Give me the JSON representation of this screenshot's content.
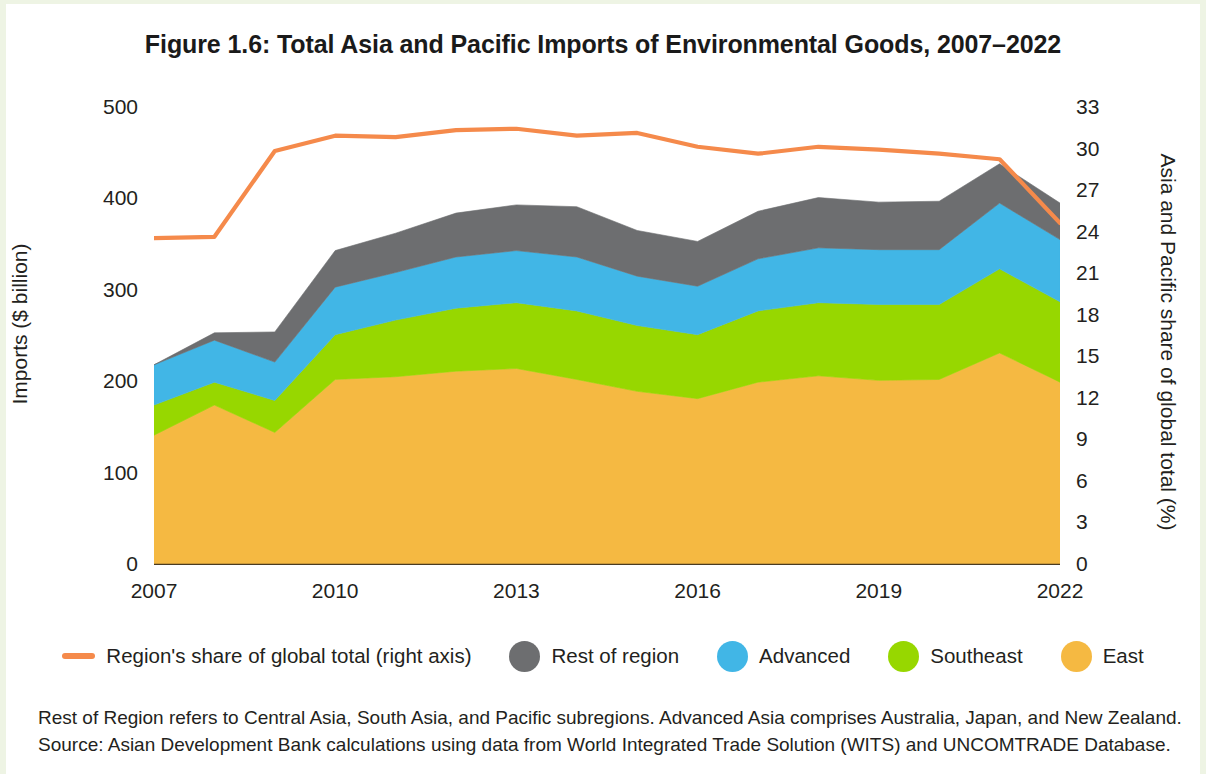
{
  "figure": {
    "title": "Figure 1.6: Total Asia and Pacific Imports of Environmental Goods, 2007–2022"
  },
  "axes": {
    "left_label": "Imports ($ billion)",
    "right_label": "Asia and Pacific share of global total (%)",
    "left_ticks": [
      "500",
      "400",
      "300",
      "200",
      "100",
      "0"
    ],
    "right_ticks": [
      "33",
      "30",
      "27",
      "24",
      "21",
      "18",
      "15",
      "12",
      "9",
      "6",
      "3",
      "0"
    ],
    "x_ticks": [
      "2007",
      "2010",
      "2013",
      "2016",
      "2019",
      "2022"
    ]
  },
  "legend": {
    "items": [
      {
        "label": "Region's share of global total (right axis)",
        "color": "#f58a4b",
        "marker": "line",
        "icon": "legend-line-icon"
      },
      {
        "label": "Rest of region",
        "color": "#6d6e70",
        "marker": "dot",
        "icon": "legend-dot-icon"
      },
      {
        "label": "Advanced",
        "color": "#41b6e6",
        "marker": "dot",
        "icon": "legend-dot-icon"
      },
      {
        "label": "Southeast",
        "color": "#97d700",
        "marker": "dot",
        "icon": "legend-dot-icon"
      },
      {
        "label": "East",
        "color": "#f5b942",
        "marker": "dot",
        "icon": "legend-dot-icon"
      }
    ]
  },
  "footnote": {
    "line1": "Rest of Region refers to Central Asia, South Asia, and Pacific subregions. Advanced Asia comprises Australia, Japan, and New Zealand.",
    "line2": "Source: Asian Development Bank calculations using data from World Integrated Trade Solution (WITS) and UNCOMTRADE Database."
  },
  "chart_data": {
    "type": "area",
    "title": "Figure 1.6: Total Asia and Pacific Imports of Environmental Goods, 2007–2022",
    "subtitle": "",
    "xlabel": "",
    "ylabel": "Imports ($ billion)",
    "y2label": "Asia and Pacific share of global total (%)",
    "stacked": true,
    "grid": false,
    "legend_position": "bottom",
    "x": [
      2007,
      2008,
      2009,
      2010,
      2011,
      2012,
      2013,
      2014,
      2015,
      2016,
      2017,
      2018,
      2019,
      2020,
      2021,
      2022
    ],
    "xlim": [
      2007,
      2022
    ],
    "ylim": [
      0,
      500
    ],
    "y2lim": [
      0,
      33
    ],
    "yticks": [
      0,
      100,
      200,
      300,
      400,
      500
    ],
    "y2ticks": [
      0,
      3,
      6,
      9,
      12,
      15,
      18,
      21,
      24,
      27,
      30,
      33
    ],
    "xticks": [
      2007,
      2010,
      2013,
      2016,
      2019,
      2022
    ],
    "series": [
      {
        "name": "East",
        "color": "#f5b942",
        "axis": "left",
        "values": [
          142,
          175,
          145,
          203,
          206,
          212,
          215,
          203,
          190,
          182,
          200,
          207,
          202,
          203,
          232,
          200
        ]
      },
      {
        "name": "Southeast",
        "color": "#97d700",
        "axis": "left",
        "values": [
          33,
          25,
          35,
          49,
          62,
          69,
          72,
          75,
          72,
          70,
          78,
          80,
          83,
          82,
          92,
          88
        ]
      },
      {
        "name": "Advanced",
        "color": "#41b6e6",
        "axis": "left",
        "values": [
          44,
          46,
          42,
          52,
          52,
          56,
          57,
          59,
          54,
          53,
          57,
          60,
          60,
          60,
          72,
          68
        ]
      },
      {
        "name": "Rest of region",
        "color": "#6d6e70",
        "axis": "left",
        "values": [
          0,
          8,
          33,
          40,
          43,
          48,
          50,
          55,
          50,
          49,
          52,
          55,
          52,
          53,
          43,
          40
        ]
      },
      {
        "name": "Region's share of global total (right axis)",
        "color": "#f58a4b",
        "axis": "right",
        "type": "line",
        "values": [
          23.6,
          23.7,
          29.9,
          31.0,
          30.9,
          31.4,
          31.5,
          31.0,
          31.2,
          30.2,
          29.7,
          30.2,
          30.0,
          29.7,
          29.3,
          24.7
        ]
      }
    ],
    "stack_totals": [
      219,
      254,
      255,
      344,
      363,
      385,
      394,
      392,
      366,
      354,
      387,
      402,
      397,
      398,
      439,
      396
    ]
  }
}
